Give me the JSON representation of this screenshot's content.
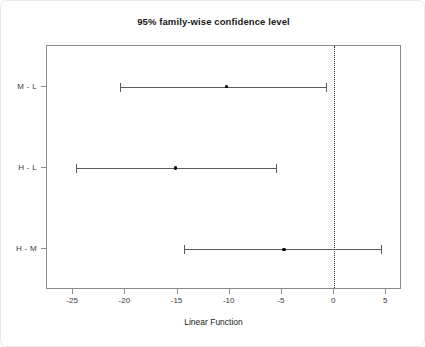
{
  "chart_data": {
    "type": "scatter",
    "title": "95% family-wise confidence level",
    "xlabel": "Linear Function",
    "ylabel": "",
    "xlim": [
      -27.5,
      6.5
    ],
    "xticks": [
      -25,
      -20,
      -15,
      -10,
      -5,
      0,
      5
    ],
    "xticklabels": [
      "-25",
      "-20",
      "-15",
      "-10",
      "-5",
      "0",
      "5"
    ],
    "categories": [
      "M - L",
      "H - L",
      "H - M"
    ],
    "grid": false,
    "legend": "none",
    "reference_line": {
      "x": 0,
      "style": "dotted"
    },
    "series": [
      {
        "name": "95% confidence intervals",
        "points": [
          {
            "label": "M - L",
            "estimate": -10.3,
            "lower": -20.5,
            "upper": -0.8
          },
          {
            "label": "H - L",
            "estimate": -15.2,
            "lower": -24.7,
            "upper": -5.6
          },
          {
            "label": "H - M",
            "estimate": -4.8,
            "lower": -14.4,
            "upper": 4.5
          }
        ]
      }
    ],
    "colors": {
      "frame": "#8c8c8c",
      "interval": "#5a5a5a",
      "point": "#000000",
      "reference": "#2b2b2b",
      "background": "#ffffff"
    }
  }
}
